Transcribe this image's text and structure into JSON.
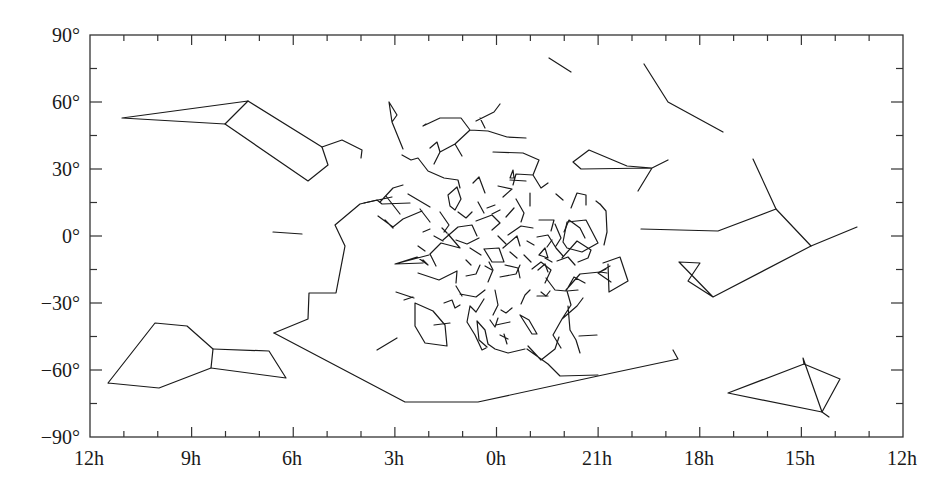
{
  "chart_data": {
    "type": "line",
    "title": "",
    "xlabel": "",
    "ylabel": "",
    "x_axis": {
      "unit": "hours of right ascension",
      "direction": "decreasing to the right",
      "tick_labels": [
        "12h",
        "9h",
        "6h",
        "3h",
        "0h",
        "21h",
        "18h",
        "15h",
        "12h"
      ],
      "range": [
        "12h",
        "12h"
      ]
    },
    "y_axis": {
      "unit": "degrees of declination",
      "tick_labels": [
        "90°",
        "60°",
        "30°",
        "0°",
        "−30°",
        "−60°",
        "−90°"
      ],
      "ylim": [
        -90,
        90
      ]
    },
    "grid": false,
    "legend": null,
    "series": [
      {
        "name": "upper-left-kite",
        "points_px": [
          [
            122,
            118
          ],
          [
            248,
            101
          ],
          [
            225,
            124
          ],
          [
            122,
            118
          ]
        ]
      },
      {
        "name": "upper-left-body",
        "points_px": [
          [
            248,
            101
          ],
          [
            322,
            147
          ],
          [
            328,
            165
          ],
          [
            308,
            181
          ],
          [
            225,
            124
          ]
        ]
      },
      {
        "name": "upper-left-tail",
        "points_px": [
          [
            322,
            147
          ],
          [
            342,
            140
          ],
          [
            362,
            150
          ],
          [
            361,
            158
          ]
        ]
      },
      {
        "name": "lower-left-hexagon",
        "points_px": [
          [
            108,
            383
          ],
          [
            155,
            323
          ],
          [
            187,
            326
          ],
          [
            213,
            349
          ],
          [
            211,
            368
          ],
          [
            159,
            388
          ],
          [
            108,
            383
          ]
        ]
      },
      {
        "name": "lower-left-quad",
        "points_px": [
          [
            213,
            349
          ],
          [
            269,
            351
          ],
          [
            286,
            378
          ],
          [
            211,
            368
          ]
        ]
      },
      {
        "name": "big-southern-boundary",
        "points_px": [
          [
            274,
            333
          ],
          [
            308,
            319
          ],
          [
            309,
            293
          ],
          [
            336,
            293
          ],
          [
            345,
            246
          ],
          [
            335,
            225
          ],
          [
            360,
            204
          ],
          [
            377,
            200
          ],
          [
            382,
            204
          ],
          [
            410,
            203
          ]
        ]
      },
      {
        "name": "southern-sweep",
        "points_px": [
          [
            274,
            333
          ],
          [
            405,
            402
          ],
          [
            478,
            402
          ],
          [
            598,
            376
          ],
          [
            678,
            359
          ],
          [
            673,
            350
          ]
        ]
      },
      {
        "name": "right-pentagon",
        "points_px": [
          [
            641,
            229
          ],
          [
            718,
            231
          ],
          [
            776,
            209
          ],
          [
            811,
            246
          ],
          [
            713,
            297
          ],
          [
            679,
            262
          ],
          [
            700,
            263
          ],
          [
            688,
            281
          ],
          [
            713,
            297
          ]
        ]
      },
      {
        "name": "right-upper-arc",
        "points_px": [
          [
            776,
            209
          ],
          [
            753,
            159
          ]
        ]
      },
      {
        "name": "right-tail",
        "points_px": [
          [
            811,
            246
          ],
          [
            857,
            227
          ]
        ]
      },
      {
        "name": "top-right-arm",
        "points_px": [
          [
            644,
            64
          ],
          [
            668,
            102
          ],
          [
            723,
            132
          ]
        ]
      },
      {
        "name": "top-mid-stick",
        "points_px": [
          [
            549,
            58
          ],
          [
            571,
            72
          ]
        ]
      },
      {
        "name": "lower-right-quad",
        "points_px": [
          [
            728,
            393
          ],
          [
            804,
            364
          ],
          [
            840,
            379
          ],
          [
            822,
            412
          ],
          [
            728,
            393
          ]
        ]
      },
      {
        "name": "lower-right-spurs",
        "points_px": [
          [
            804,
            364
          ],
          [
            803,
            358
          ],
          [
            822,
            412
          ],
          [
            829,
            417
          ]
        ]
      },
      {
        "name": "left-dash-1",
        "points_px": [
          [
            273,
            232
          ],
          [
            302,
            234
          ]
        ]
      },
      {
        "name": "mid-left-dash",
        "points_px": [
          [
            377,
            350
          ],
          [
            397,
            338
          ]
        ]
      }
    ],
    "central_cluster": {
      "region_px": {
        "x": [
          370,
          640
        ],
        "y": [
          95,
          375
        ]
      },
      "note": "dense cluster of many small constellation stick figures around 0h, 0°"
    }
  },
  "axes": {
    "x_labels": [
      "12h",
      "9h",
      "6h",
      "3h",
      "0h",
      "21h",
      "18h",
      "15h",
      "12h"
    ],
    "y_labels": [
      "90°",
      "60°",
      "30°",
      "0°",
      "−30°",
      "−60°",
      "−90°"
    ]
  },
  "colors": {
    "line": "#1a1a1a",
    "frame": "#333333",
    "background": "#ffffff"
  }
}
